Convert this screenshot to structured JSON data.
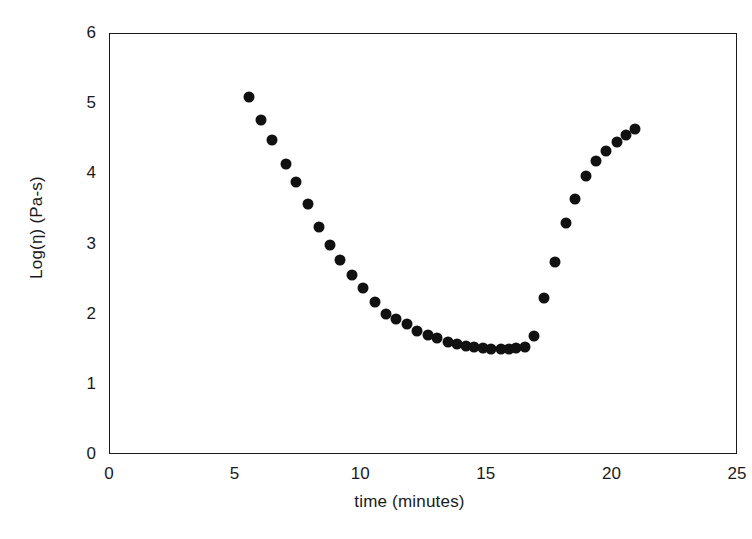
{
  "chart_data": {
    "type": "scatter",
    "title": "",
    "xlabel": "time (minutes)",
    "ylabel": "Log(η)  (Pa-s)",
    "xlim": [
      0,
      25
    ],
    "ylim": [
      0,
      6
    ],
    "xticks": [
      "0",
      "5",
      "10",
      "15",
      "20",
      "25"
    ],
    "yticks": [
      "0",
      "1",
      "2",
      "3",
      "4",
      "5",
      "6"
    ],
    "xtick_values": [
      0,
      5,
      10,
      15,
      20,
      25
    ],
    "ytick_values": [
      0,
      1,
      2,
      3,
      4,
      5,
      6
    ],
    "grid": false,
    "legend": false,
    "marker": {
      "shape": "circle",
      "color": "#111111",
      "size_px": 11
    },
    "series": [
      {
        "name": "Log(viscosity)",
        "points": [
          [
            5.57,
            5.09
          ],
          [
            6.07,
            4.76
          ],
          [
            6.49,
            4.47
          ],
          [
            7.03,
            4.13
          ],
          [
            7.45,
            3.88
          ],
          [
            7.91,
            3.56
          ],
          [
            8.37,
            3.23
          ],
          [
            8.78,
            2.98
          ],
          [
            9.2,
            2.77
          ],
          [
            9.66,
            2.55
          ],
          [
            10.11,
            2.36
          ],
          [
            10.57,
            2.17
          ],
          [
            11.03,
            1.99
          ],
          [
            11.44,
            1.92
          ],
          [
            11.86,
            1.85
          ],
          [
            12.27,
            1.76
          ],
          [
            12.69,
            1.69
          ],
          [
            13.06,
            1.65
          ],
          [
            13.48,
            1.6
          ],
          [
            13.85,
            1.57
          ],
          [
            14.22,
            1.54
          ],
          [
            14.52,
            1.53
          ],
          [
            14.89,
            1.51
          ],
          [
            15.22,
            1.5
          ],
          [
            15.6,
            1.49
          ],
          [
            15.93,
            1.49
          ],
          [
            16.22,
            1.51
          ],
          [
            16.55,
            1.53
          ],
          [
            16.93,
            1.68
          ],
          [
            17.3,
            2.23
          ],
          [
            17.76,
            2.74
          ],
          [
            18.18,
            3.29
          ],
          [
            18.55,
            3.64
          ],
          [
            18.97,
            3.96
          ],
          [
            19.39,
            4.18
          ],
          [
            19.8,
            4.32
          ],
          [
            20.22,
            4.44
          ],
          [
            20.6,
            4.55
          ],
          [
            20.93,
            4.63
          ]
        ]
      }
    ]
  },
  "axes": {
    "x_title": "time (minutes)",
    "y_title": "Log(η)  (Pa-s)"
  }
}
